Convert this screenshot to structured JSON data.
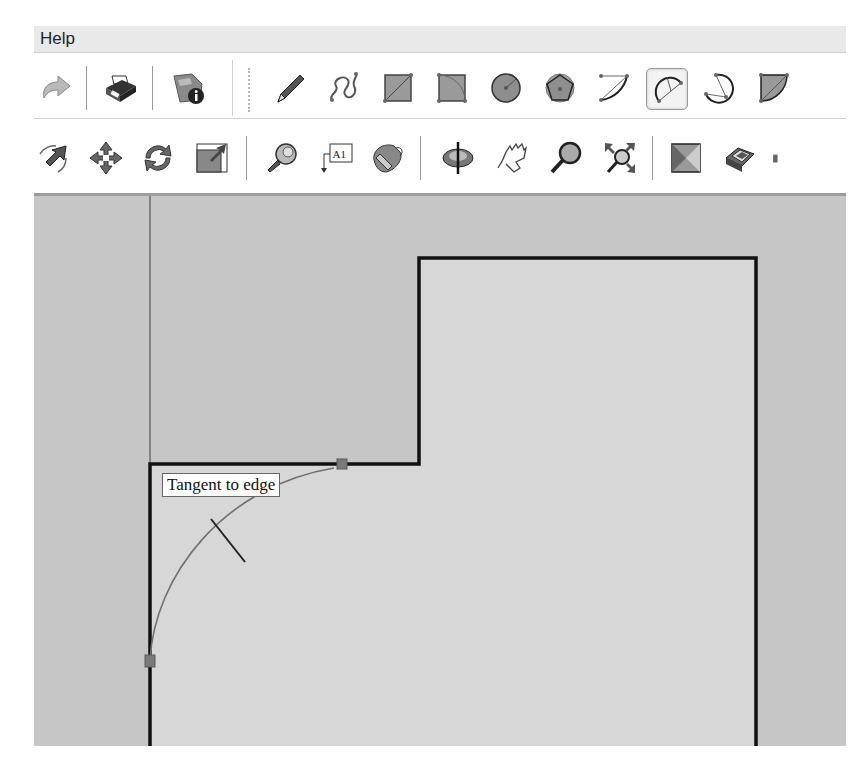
{
  "menubar": {
    "items": [
      {
        "label": "Help"
      }
    ]
  },
  "toolbar_top": {
    "tools": [
      {
        "name": "redo",
        "icon": "redo-arrow-icon"
      },
      {
        "name": "print",
        "icon": "printer-icon"
      },
      {
        "name": "model-info",
        "icon": "model-info-icon"
      },
      {
        "name": "line",
        "icon": "pencil-icon"
      },
      {
        "name": "freehand",
        "icon": "freehand-icon"
      },
      {
        "name": "rectangle",
        "icon": "rectangle-icon"
      },
      {
        "name": "rotated-rectangle",
        "icon": "rotated-rectangle-icon"
      },
      {
        "name": "circle",
        "icon": "circle-icon"
      },
      {
        "name": "polygon",
        "icon": "polygon-icon"
      },
      {
        "name": "arc",
        "icon": "arc-icon"
      },
      {
        "name": "2-point-arc",
        "icon": "two-point-arc-icon",
        "active": true
      },
      {
        "name": "3-point-arc",
        "icon": "three-point-arc-icon"
      },
      {
        "name": "pie",
        "icon": "pie-icon"
      }
    ]
  },
  "toolbar_bottom": {
    "tools": [
      {
        "name": "follow-me",
        "icon": "follow-me-icon"
      },
      {
        "name": "move",
        "icon": "move-icon"
      },
      {
        "name": "rotate",
        "icon": "rotate-icon"
      },
      {
        "name": "scale",
        "icon": "scale-icon"
      },
      {
        "name": "tape-measure",
        "icon": "tape-measure-icon"
      },
      {
        "name": "text",
        "icon": "text-label-icon",
        "glyph": "A1"
      },
      {
        "name": "paint-bucket",
        "icon": "paint-bucket-icon"
      },
      {
        "name": "orbit",
        "icon": "orbit-icon"
      },
      {
        "name": "pan",
        "icon": "hand-pan-icon"
      },
      {
        "name": "zoom",
        "icon": "zoom-magnifier-icon"
      },
      {
        "name": "zoom-extents",
        "icon": "zoom-extents-icon"
      },
      {
        "name": "section-plane",
        "icon": "section-plane-icon"
      },
      {
        "name": "components",
        "icon": "components-icon"
      }
    ]
  },
  "canvas": {
    "tooltip": "Tangent to edge",
    "colors": {
      "background": "#c6c6c6",
      "face": "#d8d8d8",
      "edge": "#111111",
      "endpoint": "#7a7a7a"
    }
  }
}
